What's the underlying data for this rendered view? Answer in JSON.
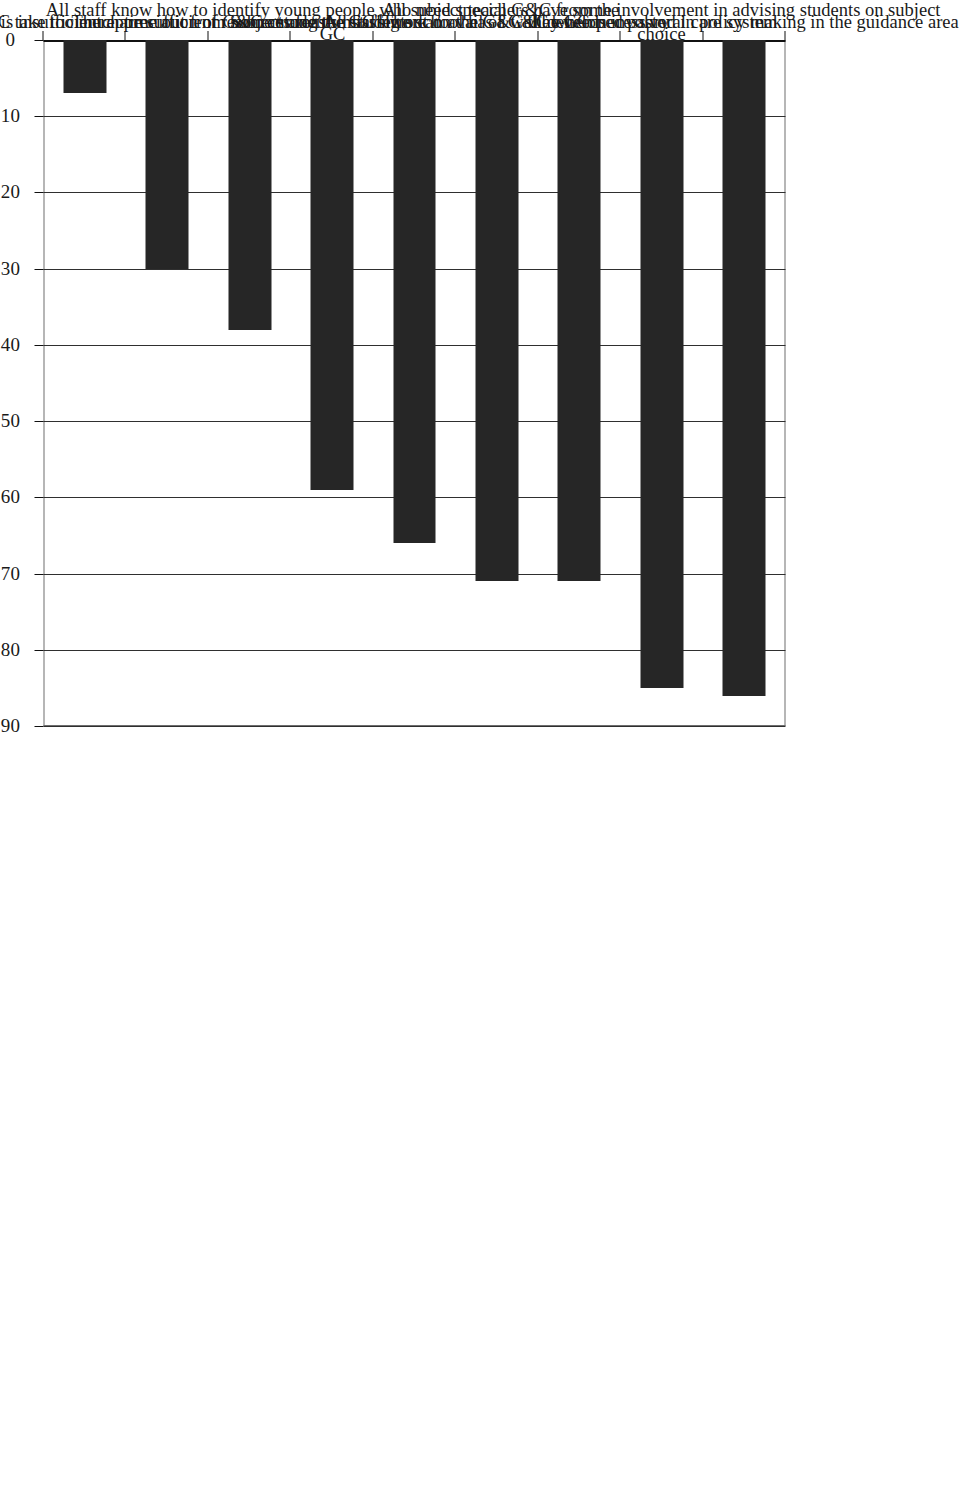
{
  "chart_data": {
    "type": "bar",
    "orientation": "vertical",
    "page_rotation_degrees": 90,
    "title": "",
    "subtitle": "",
    "xlabel": "",
    "ylabel": "",
    "categories": [
      "The GC is involved in policy making in the guidance area",
      "All subject teachers have some involvement in advising students on subject choice",
      "The school has a well developed pastoral care system",
      "All students can avail of G&C when necessary",
      "Some students missing out on the G&C they need",
      "All staff know how to identify young people who need special G&C from the GC",
      "There are sufficient resources for the GC's work",
      "There is insufficient appreciation of G&C among the staff",
      "Some staff think G&C take too much time out from subject areas"
    ],
    "category_lines": [
      [
        "The GC is involved in policy making in the guidance area"
      ],
      [
        "All subject teachers have some involvement in advising students on subject",
        "choice"
      ],
      [
        "The school has a well developed pastoral care system"
      ],
      [
        "All students can avail of G&C when necessary"
      ],
      [
        "Some students missing out on the G&C they need"
      ],
      [
        "All staff know how to identify young people who need special G&C from the",
        "GC"
      ],
      [
        "There are sufficient resources for the GC's work"
      ],
      [
        "There is insufficient appreciation of G&C among the staff"
      ],
      [
        "Some staff think G&C take too much time out from subject areas"
      ]
    ],
    "values": [
      86,
      85,
      71,
      71,
      66,
      59,
      38,
      30,
      7
    ],
    "ylim": [
      0,
      90
    ],
    "ytick_labels": [
      "0",
      "10",
      "20",
      "30",
      "40",
      "50",
      "60",
      "70",
      "80",
      "90"
    ],
    "ytick_values": [
      0,
      10,
      20,
      30,
      40,
      50,
      60,
      70,
      80,
      90
    ],
    "grid": true,
    "grid_axis": "value",
    "legend": false,
    "legend_position": "none",
    "bar_color": "#262626",
    "background_color": "#ffffff",
    "axis_color": "#111111",
    "gridline_color": "#2f2f2f"
  }
}
